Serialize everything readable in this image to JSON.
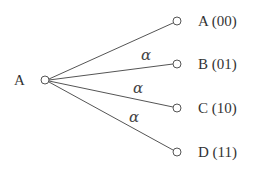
{
  "diagram": {
    "type": "tree",
    "root": {
      "label": "A",
      "cx": 45,
      "cy": 80
    },
    "leaves": [
      {
        "label": "A (00)",
        "cx": 177,
        "cy": 21,
        "edge_label": ""
      },
      {
        "label": "B (01)",
        "cx": 177,
        "cy": 64,
        "edge_label": "α"
      },
      {
        "label": "C (10)",
        "cx": 177,
        "cy": 108,
        "edge_label": "α"
      },
      {
        "label": "D (11)",
        "cx": 177,
        "cy": 152,
        "edge_label": "α"
      }
    ]
  }
}
